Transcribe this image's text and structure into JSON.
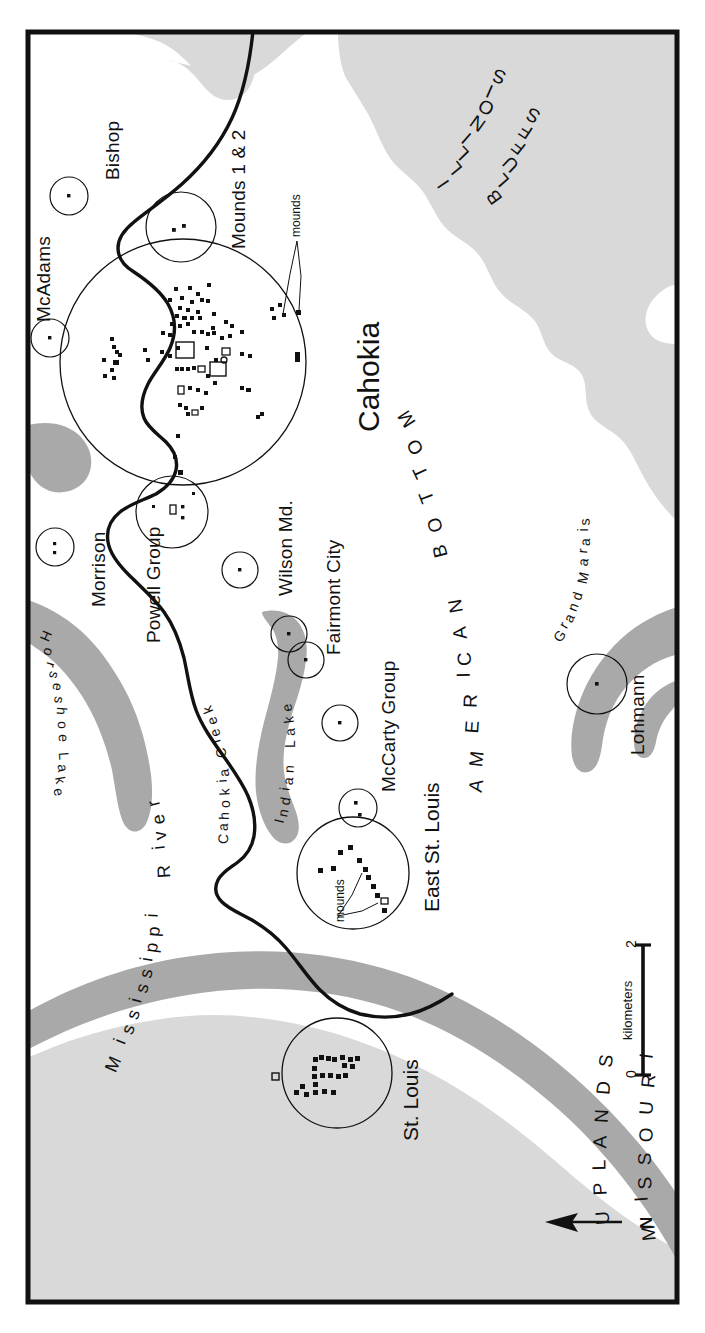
{
  "map": {
    "title": "Cahokia and the American Bottom",
    "orientation_note": "map rotated 90 degrees; north points to the left",
    "colors": {
      "upland_fill": "#d9d9d9",
      "water_fill": "#a9a9a9",
      "bluff_fill": "#d9d9d9",
      "line": "#111111",
      "border": "#111111",
      "background": "#ffffff"
    }
  },
  "regions": [
    {
      "name": "illinois-bluffs",
      "label": "ILLINOIS BLUFFS",
      "line1": "ILLINOIS",
      "line2": "BLUFFS"
    },
    {
      "name": "american-bottom",
      "label": "AMERICAN BOTTOM",
      "word1": "AMERICAN",
      "word2": "BOTTOM"
    },
    {
      "name": "missouri-uplands",
      "label": "MISSOURI UPLANDS",
      "line1": "MISSOURI",
      "line2": "UPLANDS"
    }
  ],
  "water_features": [
    {
      "name": "mississippi-river",
      "label": "Mississippi River",
      "word1": "Mississippi",
      "word2": "River"
    },
    {
      "name": "horseshoe-lake",
      "label": "Horseshoe Lake"
    },
    {
      "name": "indian-lake",
      "label": "Indian Lake"
    },
    {
      "name": "grand-marais",
      "label": "Grand Marais"
    },
    {
      "name": "cahokia-creek",
      "label": "Cahokia Creek"
    }
  ],
  "sites": [
    {
      "name": "bishop",
      "label": "Bishop"
    },
    {
      "name": "mcadams",
      "label": "McAdams"
    },
    {
      "name": "mounds-1-2",
      "label": "Mounds 1 & 2"
    },
    {
      "name": "cahokia",
      "label": "Cahokia"
    },
    {
      "name": "morrison",
      "label": "Morrison"
    },
    {
      "name": "powell-group",
      "label": "Powell Group"
    },
    {
      "name": "wilson-md",
      "label": "Wilson Md."
    },
    {
      "name": "fairmont-city",
      "label": "Fairmont City"
    },
    {
      "name": "mccarty-group",
      "label": "McCarty Group"
    },
    {
      "name": "east-st-louis",
      "label": "East St. Louis"
    },
    {
      "name": "st-louis",
      "label": "St. Louis"
    },
    {
      "name": "lohmann",
      "label": "Lohmann"
    }
  ],
  "annotations": [
    {
      "name": "cahokia-mounds-callout",
      "label": "mounds"
    },
    {
      "name": "east-st-louis-mounds-callout",
      "label": "mounds"
    }
  ],
  "scale_bar": {
    "min_label": "0",
    "max_label": "2",
    "units": "kilometers"
  },
  "compass": {
    "label": "N",
    "direction": "left"
  }
}
